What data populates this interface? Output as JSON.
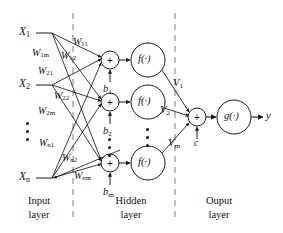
{
  "figure": {
    "background_color": "#ffffff",
    "line_color": "#1a1a1a",
    "divider_color": "#8a8a8a"
  },
  "layers": {
    "input": {
      "label_line1": "Input",
      "label_line2": "layer"
    },
    "hidden": {
      "label_line1": "Hidden",
      "label_line2": "layer"
    },
    "output": {
      "label_line1": "Ouput",
      "label_line2": "layer"
    }
  },
  "inputs": [
    {
      "name": "input-x1",
      "label": "X",
      "sub": "1"
    },
    {
      "name": "input-x2",
      "label": "X",
      "sub": "2"
    },
    {
      "name": "input-xn",
      "label": "X",
      "sub": "n"
    }
  ],
  "input_weights": [
    {
      "name": "weight-w11",
      "label": "W",
      "sub": "11"
    },
    {
      "name": "weight-w12",
      "label": "W",
      "sub": "12"
    },
    {
      "name": "weight-w1m",
      "label": "W",
      "sub": "1m"
    },
    {
      "name": "weight-w21",
      "label": "W",
      "sub": "21"
    },
    {
      "name": "weight-w22",
      "label": "W",
      "sub": "22"
    },
    {
      "name": "weight-w2m",
      "label": "W",
      "sub": "2m"
    },
    {
      "name": "weight-wn1",
      "label": "W",
      "sub": "n1"
    },
    {
      "name": "weight-wn2",
      "label": "W",
      "sub": "n2"
    },
    {
      "name": "weight-wnm",
      "label": "W",
      "sub": "nm"
    }
  ],
  "biases": [
    {
      "name": "bias-b1",
      "label": "b",
      "sub": "1"
    },
    {
      "name": "bias-b2",
      "label": "b",
      "sub": "2"
    },
    {
      "name": "bias-bm",
      "label": "b",
      "sub": "m"
    }
  ],
  "hidden_nodes": [
    {
      "name": "hidden-sum-1",
      "sum_symbol": "+",
      "activation": "f(·)"
    },
    {
      "name": "hidden-sum-2",
      "sum_symbol": "+",
      "activation": "f(·)"
    },
    {
      "name": "hidden-sum-m",
      "sum_symbol": "+",
      "activation": "f(·)"
    }
  ],
  "output_weights": [
    {
      "name": "weight-v1",
      "label": "V",
      "sub": "1"
    },
    {
      "name": "weight-v2",
      "label": "V",
      "sub": "2"
    },
    {
      "name": "weight-vm",
      "label": "V",
      "sub": "m"
    }
  ],
  "output_node": {
    "sum_symbol": "+",
    "bias_label": "c",
    "activation": "g(·)",
    "result_label": "y"
  }
}
